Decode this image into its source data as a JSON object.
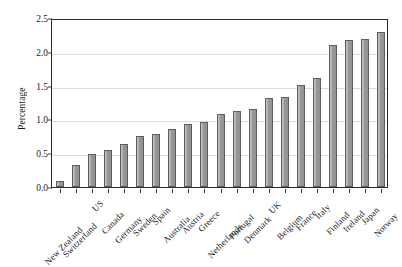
{
  "chart_data": {
    "type": "bar",
    "title": "",
    "subtitle": "",
    "xlabel": "",
    "ylabel": "Percentage",
    "ylim": [
      0,
      2.5
    ],
    "ytick_labels": [
      "0.0",
      "0.5",
      "1.0",
      "1.5",
      "2.0",
      "2.5"
    ],
    "ytick_values": [
      0.0,
      0.5,
      1.0,
      1.5,
      2.0,
      2.5
    ],
    "grid": "horizontal",
    "legend": "none",
    "bar_color": "#9a9a9a",
    "bar_edge_color": "#5d5d5d",
    "gridline_color": "#dcdcdc",
    "axis_color": "#2b2b2b",
    "background_color": "#ffffff",
    "categories": [
      "New Zealand",
      "Switzerland",
      "US",
      "Canada",
      "Germany",
      "Sweden",
      "Spain",
      "Australia",
      "Austria",
      "Greece",
      "Netherlands",
      "Portugal",
      "Denmark",
      "UK",
      "Belgium",
      "France",
      "Italy",
      "Finland",
      "Ireland",
      "Japan",
      "Norway"
    ],
    "values": [
      0.09,
      0.32,
      0.49,
      0.55,
      0.64,
      0.76,
      0.79,
      0.86,
      0.93,
      0.96,
      1.08,
      1.13,
      1.16,
      1.31,
      1.33,
      1.51,
      1.62,
      2.1,
      2.17,
      2.19,
      2.29
    ]
  }
}
